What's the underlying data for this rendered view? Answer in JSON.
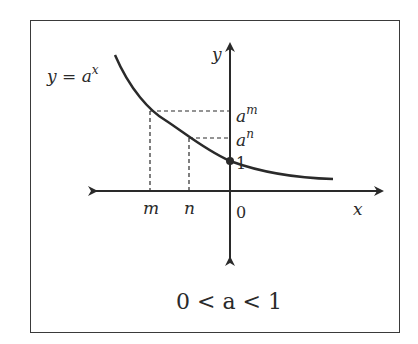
{
  "diagram": {
    "function_label": {
      "base": "y = a",
      "exp": "x"
    },
    "axis_labels": {
      "x": "x",
      "y": "y",
      "origin": "0"
    },
    "y_ticks": [
      {
        "base": "a",
        "exp": "m"
      },
      {
        "base": "a",
        "exp": "n"
      },
      {
        "value": "1"
      }
    ],
    "x_ticks": [
      "m",
      "n"
    ],
    "condition": "0 < a < 1",
    "colors": {
      "stroke": "#2a2a2a",
      "border": "#3a3a3a",
      "background": "#ffffff"
    }
  }
}
